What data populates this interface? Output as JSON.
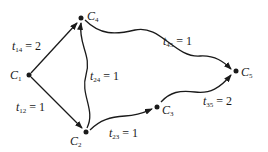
{
  "diagram": {
    "type": "directed-graph",
    "nodes": [
      {
        "id": "C1",
        "letter": "C",
        "sub": "1",
        "x": 29,
        "y": 75
      },
      {
        "id": "C2",
        "letter": "C",
        "sub": "2",
        "x": 86,
        "y": 132
      },
      {
        "id": "C3",
        "letter": "C",
        "sub": "3",
        "x": 157,
        "y": 107
      },
      {
        "id": "C4",
        "letter": "C",
        "sub": "4",
        "x": 81,
        "y": 18
      },
      {
        "id": "C5",
        "letter": "C",
        "sub": "5",
        "x": 236,
        "y": 71
      }
    ],
    "edges": [
      {
        "from": "C1",
        "to": "C4",
        "var": "t",
        "sub": "14",
        "value": "= 2"
      },
      {
        "from": "C1",
        "to": "C2",
        "var": "t",
        "sub": "12",
        "value": "= 1"
      },
      {
        "from": "C2",
        "to": "C4",
        "var": "t",
        "sub": "24",
        "value": "= 1"
      },
      {
        "from": "C4",
        "to": "C5",
        "var": "t",
        "sub": "45",
        "value": "= 1"
      },
      {
        "from": "C2",
        "to": "C3",
        "var": "t",
        "sub": "23",
        "value": "= 1"
      },
      {
        "from": "C3",
        "to": "C5",
        "var": "t",
        "sub": "35",
        "value": "= 2"
      }
    ]
  }
}
